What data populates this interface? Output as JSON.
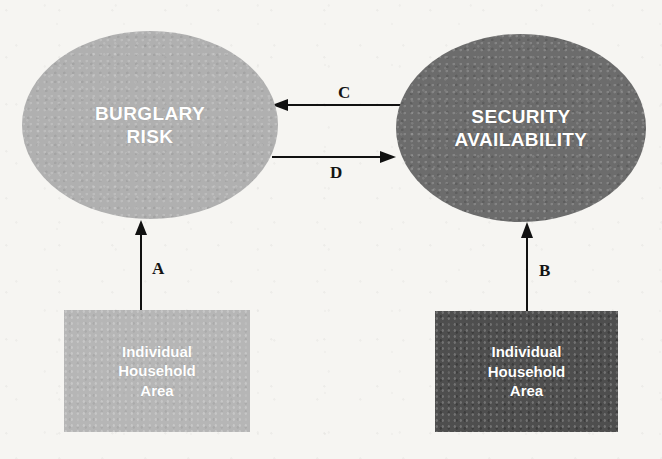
{
  "diagram": {
    "background_color": "#f6f5f2",
    "nodes": {
      "burglary_risk": {
        "shape": "ellipse",
        "label": "BURGLARY\nRISK",
        "fill_color": "#b0b0b0",
        "text_color": "#ffffff"
      },
      "security_availability": {
        "shape": "ellipse",
        "label": "SECURITY\nAVAILABILITY",
        "fill_color": "#6c6c6c",
        "text_color": "#ffffff"
      },
      "household_left": {
        "shape": "rectangle",
        "label": "Individual\nHousehold\nArea",
        "fill_color": "#b6b6b6",
        "text_color": "#ffffff"
      },
      "household_right": {
        "shape": "rectangle",
        "label": "Individual\nHousehold\nArea",
        "fill_color": "#4e4e4e",
        "text_color": "#ffffff"
      }
    },
    "edges": [
      {
        "id": "a",
        "label": "A",
        "from": "household_left",
        "to": "burglary_risk",
        "direction": "up",
        "arrowheads": 1
      },
      {
        "id": "b",
        "label": "B",
        "from": "household_right",
        "to": "security_availability",
        "direction": "up",
        "arrowheads": 1
      },
      {
        "id": "c",
        "label": "C",
        "from": "security_availability",
        "to": "burglary_risk",
        "direction": "left",
        "arrowheads": 1
      },
      {
        "id": "d",
        "label": "D",
        "from": "burglary_risk",
        "to": "security_availability",
        "direction": "right",
        "arrowheads": 1
      }
    ],
    "edge_color": "#111111"
  }
}
